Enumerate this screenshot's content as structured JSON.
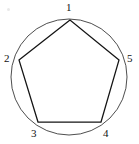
{
  "figure": {
    "type": "geometry-diagram",
    "canvas": {
      "width": 139,
      "height": 144,
      "background": "#ffffff"
    },
    "circle": {
      "name": "circumcircle",
      "center_x": 69,
      "center_y": 77,
      "radius": 58,
      "stroke": "#3a3a3a",
      "stroke_width": 0.9
    },
    "polygon": {
      "name": "pentagon",
      "sides": 5,
      "stroke": "#141414",
      "stroke_width": 1.25,
      "points": "70,20 19,60 38,122 101,122 119,60"
    },
    "vertices": [
      {
        "label": "1",
        "x": 70,
        "y": 20,
        "label_x": 66,
        "label_y": 2
      },
      {
        "label": "2",
        "x": 19,
        "y": 60,
        "label_x": 4,
        "label_y": 53
      },
      {
        "label": "3",
        "x": 38,
        "y": 122,
        "label_x": 31,
        "label_y": 128
      },
      {
        "label": "4",
        "x": 101,
        "y": 122,
        "label_x": 103,
        "label_y": 128
      },
      {
        "label": "5",
        "x": 119,
        "y": 60,
        "label_x": 127,
        "label_y": 53
      }
    ],
    "edges": [
      {
        "from": "1",
        "to": "2"
      },
      {
        "from": "2",
        "to": "3"
      },
      {
        "from": "3",
        "to": "4"
      },
      {
        "from": "4",
        "to": "5"
      },
      {
        "from": "5",
        "to": "1"
      }
    ]
  }
}
